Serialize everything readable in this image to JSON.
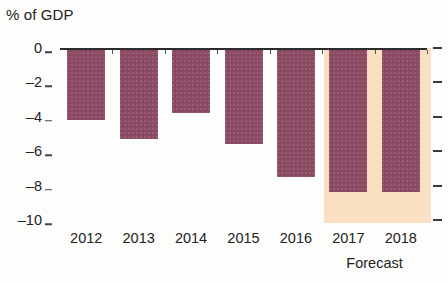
{
  "chart_data": {
    "type": "bar",
    "title": "% of GDP",
    "xlabel": "",
    "ylabel": "% of GDP",
    "categories": [
      "2012",
      "2013",
      "2014",
      "2015",
      "2016",
      "2017",
      "2018"
    ],
    "values": [
      -4.2,
      -5.3,
      -3.8,
      -5.6,
      -7.5,
      -8.4,
      -8.4
    ],
    "series": [
      {
        "name": "Budget balance",
        "values": [
          -4.2,
          -5.3,
          -3.8,
          -5.6,
          -7.5,
          -8.4,
          -8.4
        ]
      }
    ],
    "ylim": [
      -10,
      0
    ],
    "yticks": [
      0,
      -2,
      -4,
      -6,
      -8,
      -10
    ],
    "ytick_labels": [
      "0",
      "–2",
      "–4",
      "–6",
      "–8",
      "–10"
    ],
    "grid": false,
    "legend": null,
    "annotations": [
      {
        "text": "Forecast",
        "covers": [
          "2017",
          "2018"
        ],
        "position": "below-x-axis"
      }
    ],
    "forecast_start_category": "2017",
    "colors": {
      "bar": "#8c4a64",
      "forecast_band": "#fbdfc2",
      "axis": "#2b2b2b",
      "text": "#222222",
      "background": "#fdfdfb"
    }
  }
}
